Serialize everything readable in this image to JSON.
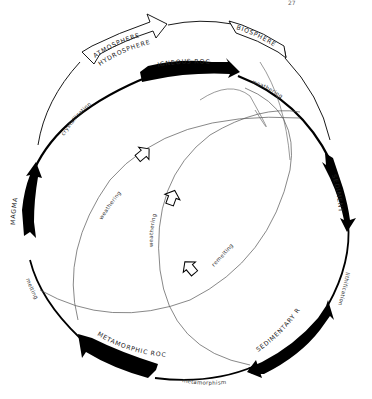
{
  "diagram": {
    "page_mark": "27",
    "colors": {
      "ink": "#000000",
      "thin_line": "#555555",
      "background": "#ffffff"
    },
    "reservoirs": {
      "atmosphere": "ATMOSPHERE",
      "hydrosphere": "HYDROSPHERE",
      "biosphere": "BIOSPHERE"
    },
    "stages": [
      {
        "id": "igneous",
        "label": "IGNEOUS ROCKS"
      },
      {
        "id": "sediments",
        "label": "SEDIMENTS"
      },
      {
        "id": "sedimentary",
        "label": "SEDIMENTARY ROCKS"
      },
      {
        "id": "metamorphic",
        "label": "METAMORPHIC ROCKS"
      },
      {
        "id": "magma",
        "label": "MAGMA"
      }
    ],
    "processes": {
      "weathering_top": "weathering",
      "lithification": "lithification",
      "metamorphism": "metamorphism",
      "melting": "melting",
      "crystallization": "crystallization",
      "weathering_inner_1": "weathering",
      "weathering_inner_2": "weathering",
      "remelting": "remelting"
    },
    "nodes": [
      "IGNEOUS ROCKS",
      "SEDIMENTS",
      "SEDIMENTARY ROCKS",
      "METAMORPHIC ROCKS",
      "MAGMA",
      "ATMOSPHERE HYDROSPHERE",
      "BIOSPHERE"
    ],
    "edges": [
      {
        "from": "IGNEOUS ROCKS",
        "to": "SEDIMENTS",
        "label": "weathering"
      },
      {
        "from": "SEDIMENTS",
        "to": "SEDIMENTARY ROCKS",
        "label": "lithification"
      },
      {
        "from": "SEDIMENTARY ROCKS",
        "to": "METAMORPHIC ROCKS",
        "label": "metamorphism"
      },
      {
        "from": "METAMORPHIC ROCKS",
        "to": "MAGMA",
        "label": "melting"
      },
      {
        "from": "MAGMA",
        "to": "IGNEOUS ROCKS",
        "label": "crystallization"
      },
      {
        "from": "MAGMA",
        "to": "ATMOSPHERE HYDROSPHERE",
        "label": ""
      },
      {
        "from": "ATMOSPHERE HYDROSPHERE",
        "to": "BIOSPHERE",
        "label": ""
      },
      {
        "from": "BIOSPHERE",
        "to": "SEDIMENTS",
        "label": ""
      },
      {
        "from": "METAMORPHIC ROCKS",
        "to": "SEDIMENTS",
        "label": "weathering"
      },
      {
        "from": "SEDIMENTARY ROCKS",
        "to": "SEDIMENTS",
        "label": "weathering"
      },
      {
        "from": "SEDIMENTARY ROCKS",
        "to": "MAGMA",
        "label": "remelting"
      }
    ]
  }
}
